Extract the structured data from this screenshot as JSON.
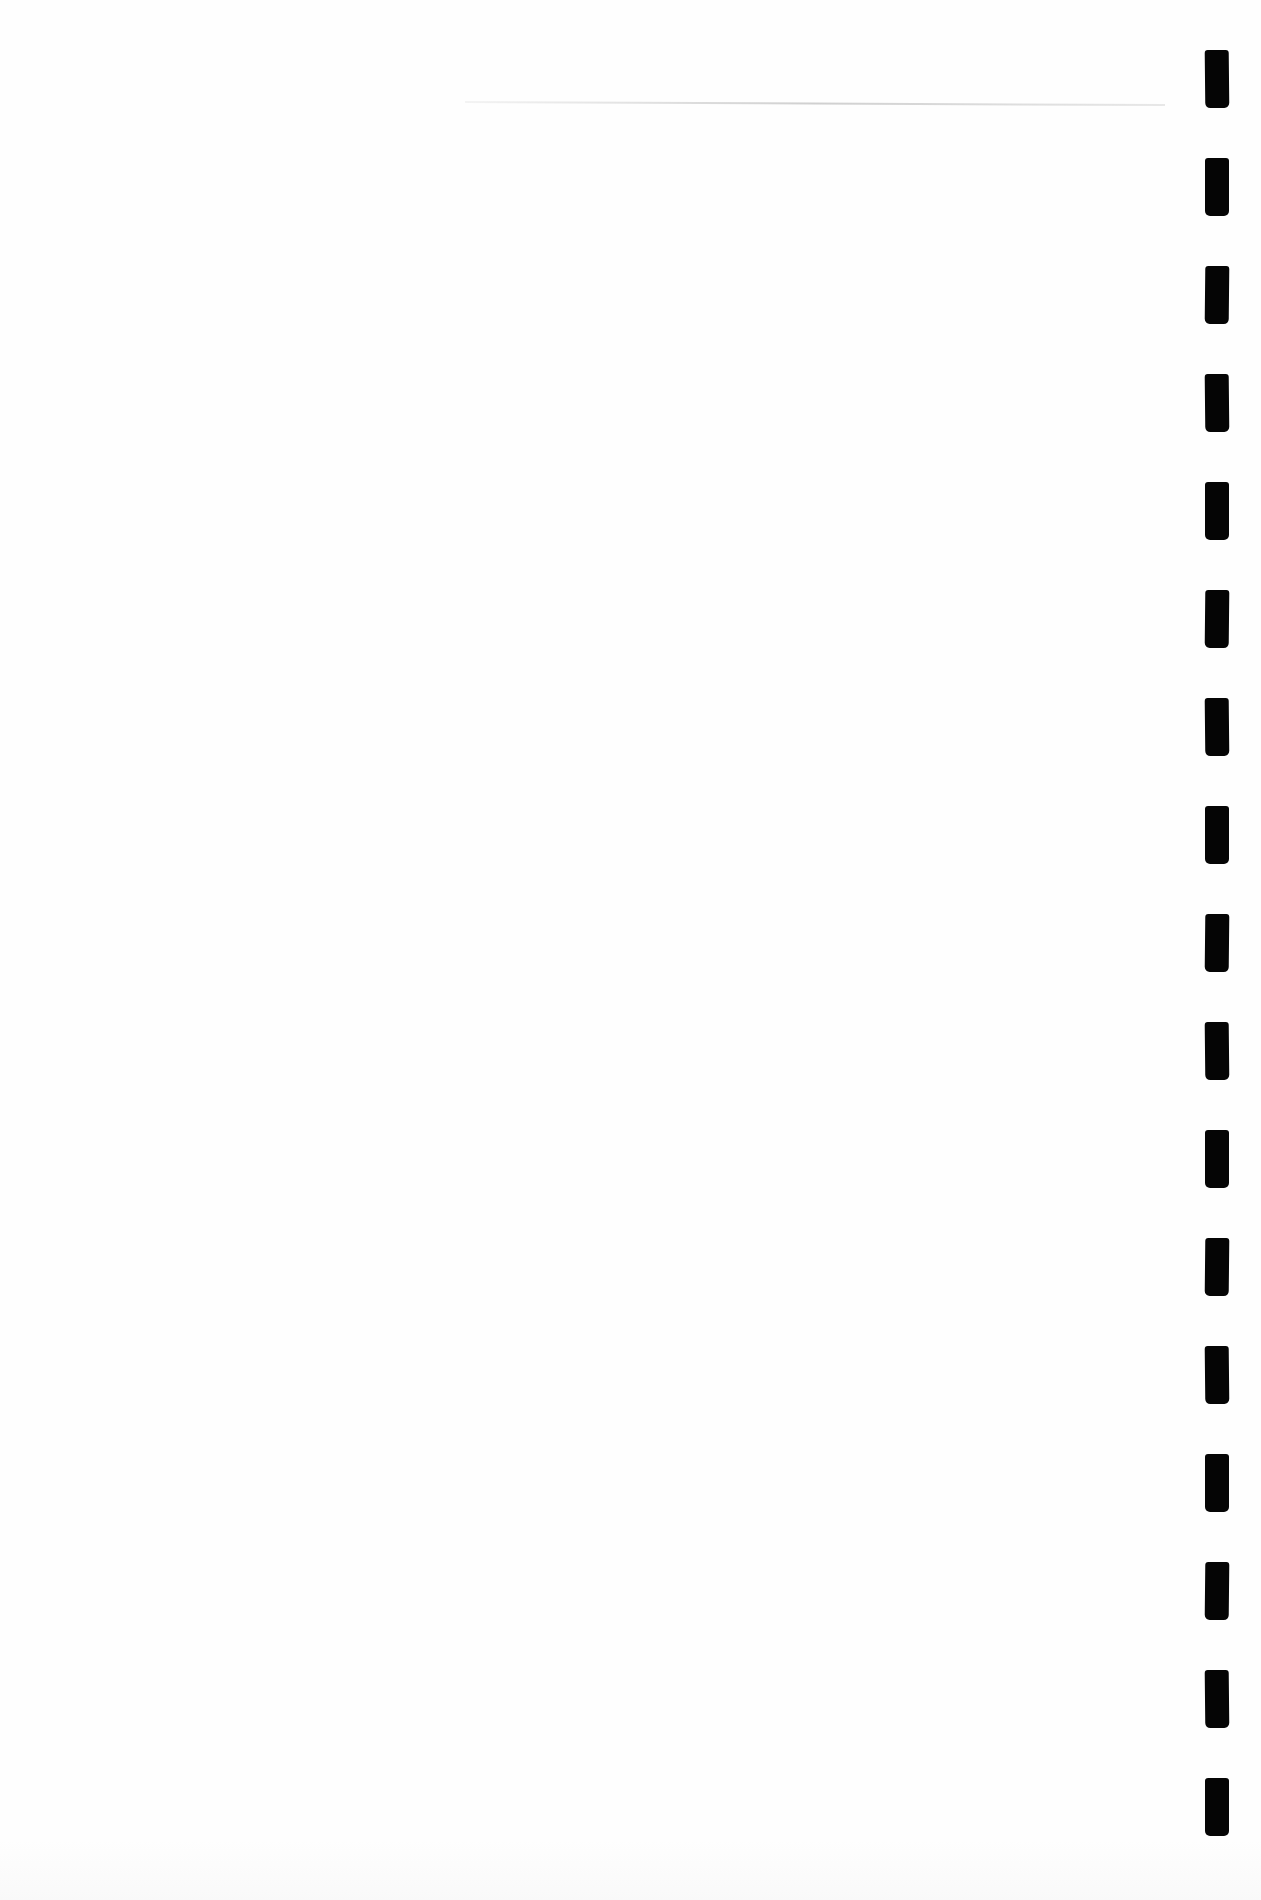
{
  "document": {
    "type": "scanned-blank-page",
    "text_content": "",
    "background_color": "#fefefe",
    "top_rule": {
      "visible": true,
      "color": "#aaaaaa",
      "y": 101,
      "x_start": 465,
      "x_end": 1165
    },
    "binding_marks": {
      "color": "#050505",
      "count": 17,
      "x": 1205,
      "width": 24,
      "height": 58,
      "y_positions": [
        50,
        158,
        266,
        374,
        482,
        590,
        698,
        806,
        914,
        1022,
        1130,
        1238,
        1346,
        1454,
        1562,
        1670,
        1778
      ]
    }
  }
}
